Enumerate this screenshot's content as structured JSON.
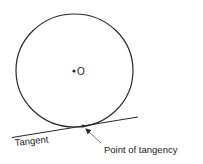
{
  "diagram": {
    "center_label": "O",
    "tangent_label": "Tangent",
    "point_label": "Point of tangency",
    "colors": {
      "stroke": "#2a2a2a",
      "background": "#ffffff"
    }
  }
}
